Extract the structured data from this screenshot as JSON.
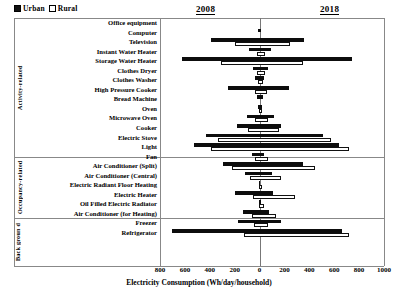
{
  "legend": {
    "urban_label": "Urban",
    "rural_label": "Rural",
    "urban_color": "#0d0d0d",
    "rural_color": "#ffffff"
  },
  "panel_headers": {
    "left_year": "2008",
    "right_year": "2018"
  },
  "groups": [
    {
      "name": "Activity-related",
      "label": "Activity-related"
    },
    {
      "name": "Occupancy-related",
      "label": "Occupancy-related"
    },
    {
      "name": "Background",
      "label": "Back groun d"
    }
  ],
  "axis": {
    "title": "Electricity Consumption (Wh/day/household)",
    "ticks": [
      "800",
      "600",
      "400",
      "200",
      "0",
      "200",
      "400",
      "600",
      "800",
      "1000"
    ],
    "left_max": 800,
    "right_max": 1000
  },
  "chart_data": {
    "type": "bar",
    "orientation": "horizontal",
    "style": "diverging-tornado",
    "title": "",
    "xlabel": "Electricity Consumption (Wh/day/household)",
    "ylabel": "",
    "xlim": [
      -800,
      1000
    ],
    "grid": false,
    "legend_position": "top-left",
    "left_panel": "2008",
    "right_panel": "2018",
    "note": "left extent = 2008 consumption, right extent = 2018 consumption",
    "categories": [
      "Office equipment",
      "Computer",
      "Television",
      "Instant Water Heater",
      "Storage Water Heater",
      "Clothes Dryer",
      "Clothes Washer",
      "High Pressure Cooker",
      "Bread Machine",
      "Oven",
      "Microwave Oven",
      "Cooker",
      "Electric Stove",
      "Light",
      "Fan",
      "Air Conditioner (Split)",
      "Air Conditioner (Central)",
      "Electric Radiant Floor Heating",
      "Electric Heater",
      "Oil Filled Electric Radiator",
      "Air Conditioner (for Heating)",
      "Freezer",
      "Refrigerator"
    ],
    "series": [
      {
        "name": "Urban",
        "left_2008": [
          0,
          10,
          390,
          85,
          625,
          55,
          40,
          250,
          20,
          15,
          100,
          185,
          430,
          530,
          60,
          290,
          120,
          5,
          200,
          5,
          130,
          175,
          700
        ],
        "right_2018": [
          0,
          15,
          355,
          95,
          740,
          70,
          35,
          240,
          25,
          20,
          120,
          175,
          510,
          640,
          35,
          350,
          100,
          5,
          110,
          15,
          75,
          170,
          660
        ]
      },
      {
        "name": "Rural",
        "left_2008": [
          0,
          0,
          200,
          20,
          310,
          20,
          10,
          35,
          0,
          5,
          40,
          90,
          330,
          390,
          35,
          220,
          75,
          5,
          55,
          5,
          60,
          45,
          125
        ],
        "right_2018": [
          0,
          0,
          230,
          25,
          330,
          25,
          15,
          45,
          0,
          5,
          55,
          140,
          560,
          700,
          55,
          430,
          160,
          5,
          265,
          20,
          120,
          55,
          700
        ]
      }
    ]
  }
}
